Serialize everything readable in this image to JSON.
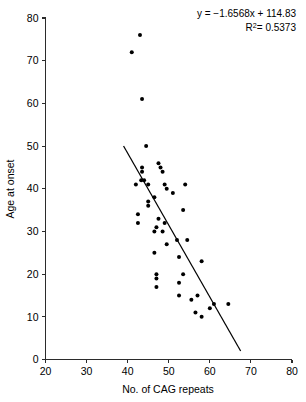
{
  "chart_data": {
    "type": "scatter",
    "title": "",
    "xlabel": "No. of CAG repeats",
    "ylabel": "Age at onset",
    "xlim": [
      20,
      80
    ],
    "ylim": [
      0,
      80
    ],
    "xticks": [
      20,
      30,
      40,
      50,
      60,
      70,
      80
    ],
    "yticks": [
      0,
      10,
      20,
      30,
      40,
      50,
      60,
      70,
      80
    ],
    "grid": false,
    "legend": null,
    "annotations": {
      "equation": "y = −1.6568x + 114.83",
      "equation_slope": -1.6568,
      "equation_intercept": 114.83,
      "r_squared_label": "R",
      "r_squared_sup": "2",
      "r_squared_value": "= 0.5373",
      "r_squared": 0.5373,
      "position": "top-right"
    },
    "trendline": {
      "x_start": 39,
      "y_start": 50,
      "x_end": 67.5,
      "y_end": 2
    },
    "points": [
      {
        "x": 41,
        "y": 72
      },
      {
        "x": 43,
        "y": 76
      },
      {
        "x": 43.5,
        "y": 61
      },
      {
        "x": 44.5,
        "y": 50
      },
      {
        "x": 47.5,
        "y": 46
      },
      {
        "x": 48,
        "y": 45
      },
      {
        "x": 48.5,
        "y": 44
      },
      {
        "x": 43.5,
        "y": 45
      },
      {
        "x": 43.5,
        "y": 44
      },
      {
        "x": 43.3,
        "y": 42
      },
      {
        "x": 44,
        "y": 42
      },
      {
        "x": 42,
        "y": 41
      },
      {
        "x": 45,
        "y": 41
      },
      {
        "x": 49,
        "y": 41
      },
      {
        "x": 54,
        "y": 41
      },
      {
        "x": 49.5,
        "y": 40
      },
      {
        "x": 51,
        "y": 39
      },
      {
        "x": 46.5,
        "y": 38
      },
      {
        "x": 45,
        "y": 37
      },
      {
        "x": 45,
        "y": 36
      },
      {
        "x": 42.5,
        "y": 34
      },
      {
        "x": 53.5,
        "y": 35
      },
      {
        "x": 47.5,
        "y": 33
      },
      {
        "x": 42.5,
        "y": 32
      },
      {
        "x": 49,
        "y": 32
      },
      {
        "x": 47,
        "y": 31
      },
      {
        "x": 46.5,
        "y": 30
      },
      {
        "x": 48.5,
        "y": 30
      },
      {
        "x": 52,
        "y": 28
      },
      {
        "x": 54.5,
        "y": 28
      },
      {
        "x": 49.5,
        "y": 27
      },
      {
        "x": 46.5,
        "y": 25
      },
      {
        "x": 52.5,
        "y": 24
      },
      {
        "x": 58,
        "y": 23
      },
      {
        "x": 47,
        "y": 20
      },
      {
        "x": 53.5,
        "y": 20
      },
      {
        "x": 47,
        "y": 19
      },
      {
        "x": 52.5,
        "y": 18
      },
      {
        "x": 47,
        "y": 17
      },
      {
        "x": 52.5,
        "y": 15
      },
      {
        "x": 57,
        "y": 15
      },
      {
        "x": 55.5,
        "y": 14
      },
      {
        "x": 61,
        "y": 13
      },
      {
        "x": 64.5,
        "y": 13
      },
      {
        "x": 60,
        "y": 12
      },
      {
        "x": 56.5,
        "y": 11
      },
      {
        "x": 58,
        "y": 10
      }
    ]
  },
  "axes": {
    "y_label": "Age at onset",
    "x_label": "No. of CAG repeats"
  }
}
